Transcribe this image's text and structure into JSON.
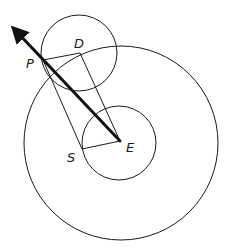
{
  "diagram": {
    "type": "geometric-construction",
    "labels": {
      "P": "P",
      "D": "D",
      "S": "S",
      "E": "E"
    },
    "elements": [
      {
        "id": "deferent-circle",
        "kind": "circle",
        "center": "E"
      },
      {
        "id": "inner-circle",
        "kind": "circle",
        "center": "E"
      },
      {
        "id": "epicycle-circle",
        "kind": "circle",
        "center": "D"
      },
      {
        "id": "line-P-D",
        "kind": "segment",
        "from": "P",
        "to": "D"
      },
      {
        "id": "line-D-E",
        "kind": "segment",
        "from": "D",
        "to": "E"
      },
      {
        "id": "line-E-S",
        "kind": "segment",
        "from": "E",
        "to": "S"
      },
      {
        "id": "line-S-P",
        "kind": "segment",
        "from": "S",
        "to": "P"
      },
      {
        "id": "arrow-E-P",
        "kind": "arrow",
        "from": "E",
        "through": "P",
        "style": "thick"
      }
    ],
    "colors": {
      "stroke": "#1a1a1a",
      "background": "#ffffff"
    }
  }
}
